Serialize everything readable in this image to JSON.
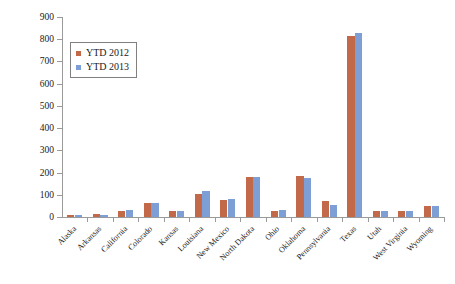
{
  "chart_data": {
    "type": "bar",
    "title": "",
    "xlabel": "",
    "ylabel": "Rig count",
    "ylim": [
      0,
      900
    ],
    "yticks": [
      0,
      100,
      200,
      300,
      400,
      500,
      600,
      700,
      800,
      900
    ],
    "ytick_labels": [
      "0",
      "100",
      "200",
      "300",
      "400",
      "500",
      "600",
      "700",
      "800",
      "900"
    ],
    "grid": false,
    "legend_position": "upper left",
    "categories": [
      "Alaska",
      "Arkansas",
      "California",
      "Colorado",
      "Kansas",
      "Louisiana",
      "New Mexico",
      "North Dakota",
      "Ohio",
      "Oklahoma",
      "Pennsylvania",
      "Texas",
      "Utah",
      "West Virginia",
      "Wyoming"
    ],
    "series": [
      {
        "name": "YTD 2012",
        "color": "#c2694a",
        "values": [
          9,
          13,
          29,
          62,
          27,
          105,
          78,
          181,
          28,
          186,
          72,
          816,
          26,
          25,
          48
        ]
      },
      {
        "name": "YTD 2013",
        "color": "#7e9fd6",
        "values": [
          9,
          11,
          30,
          65,
          28,
          116,
          82,
          180,
          31,
          176,
          55,
          828,
          27,
          27,
          50
        ]
      }
    ]
  },
  "legend": {
    "entries": [
      {
        "label": "YTD 2012",
        "color": "#c2694a"
      },
      {
        "label": "YTD 2013",
        "color": "#7e9fd6"
      }
    ]
  },
  "axis": {
    "y_title": "Rig count"
  },
  "colors": {
    "series_2012": "#c2694a",
    "series_2013": "#7e9fd6",
    "axis": "#9a9a9a",
    "text": "#1a1a1a",
    "background": "#ffffff"
  }
}
